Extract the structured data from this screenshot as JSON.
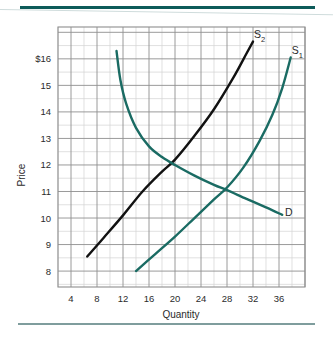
{
  "chart_data": {
    "type": "line",
    "title": "",
    "xlabel": "Quantity",
    "ylabel": "Price",
    "xlim": [
      2,
      40
    ],
    "ylim": [
      7.4,
      17.2
    ],
    "xticks": [
      4,
      8,
      12,
      16,
      20,
      24,
      28,
      32,
      36
    ],
    "xtick_labels": [
      "4",
      "8",
      "12",
      "16",
      "20",
      "24",
      "28",
      "32",
      "36"
    ],
    "yticks": [
      8,
      9,
      10,
      11,
      12,
      13,
      14,
      15,
      16
    ],
    "ytick_labels": [
      "8",
      "9",
      "10",
      "11",
      "12",
      "13",
      "14",
      "15",
      "$16"
    ],
    "grid": true,
    "grid_minor": true,
    "legend": "inline-curve-labels",
    "series": [
      {
        "name": "S2",
        "label": "S",
        "subscript": "2",
        "color": "#111111",
        "role": "supply-shifted",
        "points": [
          [
            6.5,
            8.55
          ],
          [
            9.0,
            9.25
          ],
          [
            12.0,
            10.1
          ],
          [
            15.0,
            11.0
          ],
          [
            18.0,
            11.75
          ],
          [
            20.0,
            12.2
          ],
          [
            23.0,
            13.1
          ],
          [
            26.0,
            14.1
          ],
          [
            29.0,
            15.3
          ],
          [
            31.0,
            16.2
          ],
          [
            32.0,
            16.65
          ]
        ]
      },
      {
        "name": "S1",
        "label": "S",
        "subscript": "1",
        "color": "#1a6b63",
        "role": "supply-original",
        "points": [
          [
            14.0,
            8.0
          ],
          [
            17.0,
            8.65
          ],
          [
            20.0,
            9.3
          ],
          [
            23.0,
            10.0
          ],
          [
            26.0,
            10.7
          ],
          [
            28.0,
            11.15
          ],
          [
            30.5,
            11.9
          ],
          [
            33.0,
            12.9
          ],
          [
            35.0,
            13.9
          ],
          [
            36.5,
            14.9
          ],
          [
            37.8,
            16.05
          ]
        ]
      },
      {
        "name": "D",
        "label": "D",
        "subscript": "",
        "color": "#1a6b63",
        "role": "demand",
        "points": [
          [
            11.0,
            16.3
          ],
          [
            11.6,
            15.2
          ],
          [
            12.5,
            14.3
          ],
          [
            14.0,
            13.4
          ],
          [
            16.0,
            12.7
          ],
          [
            18.0,
            12.3
          ],
          [
            20.0,
            12.0
          ],
          [
            23.0,
            11.6
          ],
          [
            26.0,
            11.25
          ],
          [
            28.0,
            11.05
          ],
          [
            31.0,
            10.72
          ],
          [
            34.0,
            10.4
          ],
          [
            36.5,
            10.12
          ]
        ]
      }
    ],
    "equilibria": [
      {
        "label": "S2 x D",
        "quantity": 20,
        "price": 12
      },
      {
        "label": "S1 x D",
        "quantity": 28,
        "price": 11
      }
    ]
  },
  "labels": {
    "s2_main": "S",
    "s2_sub": "2",
    "s1_main": "S",
    "s1_sub": "1",
    "demand": "D",
    "x_axis_title": "Quantity",
    "y_axis_title": "Price"
  },
  "colors": {
    "teal_curve": "#1a6b63",
    "black_curve": "#111111",
    "rule_top": "#0d5b59",
    "rule_bottom": "#7f9d9d",
    "grid_minor": "#d2d2d2",
    "grid_major": "#8e8e8e",
    "plot_border": "#8e8e8e"
  }
}
